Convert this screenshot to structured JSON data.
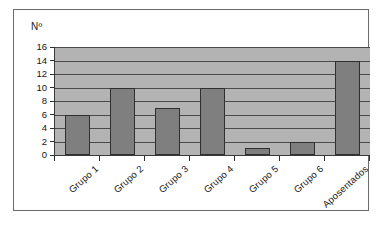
{
  "chart_data": {
    "type": "bar",
    "title": "",
    "xlabel": "",
    "ylabel": "Nº",
    "categories": [
      "Grupo 1",
      "Grupo 2",
      "Grupo 3",
      "Grupo 4",
      "Grupo 5",
      "Grupo 6",
      "Aposentados"
    ],
    "values": [
      6,
      10,
      7,
      10,
      1,
      2,
      14
    ],
    "ylim": [
      0,
      16
    ],
    "yticks": [
      0,
      2,
      4,
      6,
      8,
      10,
      12,
      14,
      16
    ],
    "ytick_labels": [
      "0",
      "2",
      "4",
      "6",
      "8",
      "10",
      "12",
      "14",
      "16"
    ],
    "grid": true,
    "legend": null,
    "colors": {
      "bar_fill": "#7f7f7f",
      "bar_border": "#2f2f2f",
      "plot_background": "#b3b3b3",
      "gridline": "#4a4a4a",
      "axis": "#2e2e2e",
      "frame_border": "#6b6b6b",
      "text": "#161616",
      "page_background": "#ffffff"
    }
  }
}
